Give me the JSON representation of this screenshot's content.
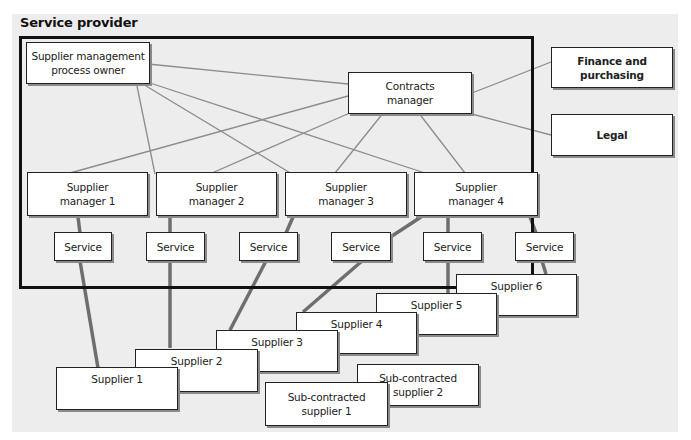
{
  "title": "Service provider",
  "colors": {
    "panel": "#ededed",
    "frame": "#111111",
    "thin_line": "#8c8c8c",
    "thick_line": "#6e6e6e",
    "box_fill": "#ffffff"
  },
  "nodes": {
    "process_owner": "Supplier management\nprocess owner",
    "contracts_manager": "Contracts\nmanager",
    "finance": "Finance and\npurchasing",
    "legal": "Legal",
    "managers": [
      "Supplier\nmanager 1",
      "Supplier\nmanager 2",
      "Supplier\nmanager 3",
      "Supplier\nmanager 4"
    ],
    "services": [
      "Service",
      "Service",
      "Service",
      "Service",
      "Service",
      "Service"
    ],
    "suppliers": [
      "Supplier 1",
      "Supplier 2",
      "Supplier 3",
      "Supplier 4",
      "Supplier 5",
      "Supplier 6"
    ],
    "subcontracted": [
      "Sub-contracted\nsupplier 1",
      "Sub-contracted\nsupplier 2"
    ]
  },
  "edges": {
    "thin": [
      [
        "process_owner",
        "contracts_manager"
      ],
      [
        "process_owner",
        "manager_2"
      ],
      [
        "process_owner",
        "manager_3"
      ],
      [
        "process_owner",
        "manager_4"
      ],
      [
        "contracts_manager",
        "manager_1"
      ],
      [
        "contracts_manager",
        "manager_2"
      ],
      [
        "contracts_manager",
        "manager_3"
      ],
      [
        "contracts_manager",
        "manager_4"
      ],
      [
        "contracts_manager",
        "finance"
      ],
      [
        "contracts_manager",
        "legal"
      ]
    ],
    "thick": [
      [
        "manager_1",
        "service_1"
      ],
      [
        "manager_2",
        "service_2"
      ],
      [
        "manager_3",
        "service_3"
      ],
      [
        "manager_4",
        "service_4"
      ],
      [
        "manager_4",
        "service_5"
      ],
      [
        "manager_4",
        "service_6"
      ],
      [
        "service_1",
        "supplier_1"
      ],
      [
        "service_2",
        "supplier_2"
      ],
      [
        "service_3",
        "supplier_3"
      ],
      [
        "service_4",
        "supplier_4"
      ],
      [
        "service_5",
        "supplier_5"
      ],
      [
        "service_6",
        "supplier_6"
      ],
      [
        "supplier_3",
        "subcontracted_1"
      ],
      [
        "supplier_4",
        "subcontracted_2"
      ]
    ]
  }
}
